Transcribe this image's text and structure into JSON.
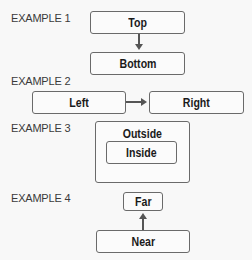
{
  "examples": [
    {
      "label": "EXAMPLE 1",
      "boxes": [
        "Top",
        "Bottom"
      ],
      "arrow": "down"
    },
    {
      "label": "EXAMPLE 2",
      "boxes": [
        "Left",
        "Right"
      ],
      "arrow": "right"
    },
    {
      "label": "EXAMPLE 3",
      "boxes": [
        "Outside",
        "Inside"
      ],
      "relation": "nested"
    },
    {
      "label": "EXAMPLE 4",
      "boxes": [
        "Far",
        "Near"
      ],
      "arrow": "up"
    }
  ],
  "colors": {
    "border": "#6a6a6a",
    "arrow": "#555555",
    "text": "#1a1a1a",
    "label": "#3a3a3a"
  }
}
